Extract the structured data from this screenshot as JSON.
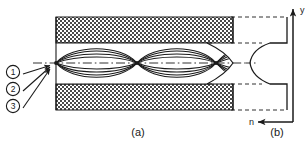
{
  "figure": {
    "panels": [
      {
        "id": "a",
        "label": "(a)",
        "caption_x": 138,
        "caption_y": 135
      },
      {
        "id": "b",
        "label": "(b)",
        "caption_x": 277,
        "caption_y": 135
      }
    ],
    "rays": {
      "items": [
        {
          "label": "1",
          "glyph": "①",
          "circle_x": 13,
          "circle_y": 71,
          "arrow_tip_x": 50,
          "arrow_tip_y": 62
        },
        {
          "label": "2",
          "glyph": "②",
          "circle_x": 13,
          "circle_y": 88,
          "arrow_tip_x": 50,
          "arrow_tip_y": 63
        },
        {
          "label": "3",
          "glyph": "③",
          "circle_x": 13,
          "circle_y": 105,
          "arrow_tip_x": 50,
          "arrow_tip_y": 64
        }
      ]
    },
    "axes": {
      "y_label": "y",
      "n_label": "n"
    },
    "colors": {
      "ink": "#1a1a1a",
      "cladding_fill": "#9a9a9a",
      "background": "#ffffff"
    },
    "geometry": {
      "core_top_y": 43,
      "core_bottom_y": 84,
      "axis_y": 63,
      "fiber_left_x": 56,
      "fiber_right_x": 233,
      "clad_top_y": 17,
      "clad_bottom_y": 110,
      "node_xs": [
        56,
        137,
        216
      ]
    }
  }
}
